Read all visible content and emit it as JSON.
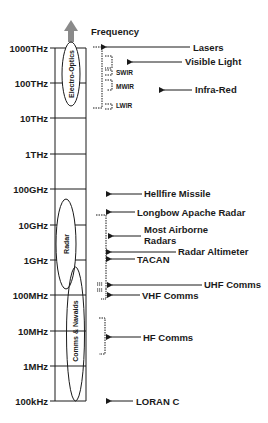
{
  "axis": {
    "title": "Frequency",
    "ticks": [
      {
        "label": "1000THz",
        "y": 48
      },
      {
        "label": "100THz",
        "y": 83
      },
      {
        "label": "10THz",
        "y": 118
      },
      {
        "label": "1THz",
        "y": 154
      },
      {
        "label": "100GHz",
        "y": 189
      },
      {
        "label": "10GHz",
        "y": 225
      },
      {
        "label": "1GHz",
        "y": 260
      },
      {
        "label": "100MHz",
        "y": 295
      },
      {
        "label": "10MHz",
        "y": 331
      },
      {
        "label": "1MHz",
        "y": 366
      },
      {
        "label": "100kHz",
        "y": 401
      }
    ]
  },
  "bands": [
    {
      "label": "Electro-Optics"
    },
    {
      "label": "Radar"
    },
    {
      "label": "Comms & Navaids"
    }
  ],
  "applications": [
    {
      "label": "Lasers"
    },
    {
      "label": "Visible Light"
    },
    {
      "label": "Infra-Red"
    },
    {
      "label": "Hellfire Missile"
    },
    {
      "label": "Longbow Apache Radar"
    },
    {
      "label": "Most Airborne",
      "label2": "Radars"
    },
    {
      "label": "Radar Altimeter"
    },
    {
      "label": "TACAN"
    },
    {
      "label": "UHF Comms"
    },
    {
      "label": "VHF Comms"
    },
    {
      "label": "HF Comms"
    },
    {
      "label": "LORAN C"
    }
  ],
  "ir_subbands": [
    {
      "label": "SWIR"
    },
    {
      "label": "MWIR"
    },
    {
      "label": "LWIR"
    }
  ],
  "colors": {
    "line": "#1a1a1a",
    "arrow_up": "#8a8a8a"
  }
}
